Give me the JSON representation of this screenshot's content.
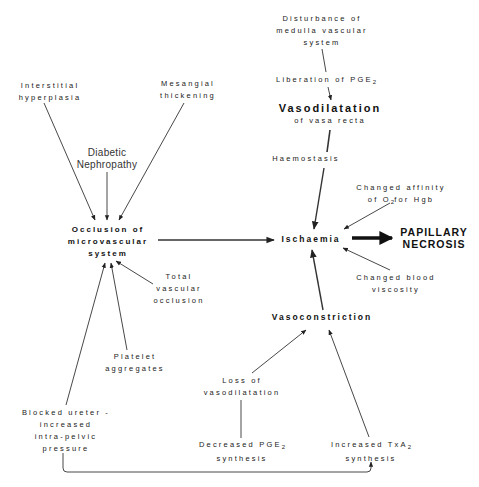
{
  "diagram": {
    "nodes": {
      "disturbance": {
        "lines": [
          "Disturbance of",
          "medulla vascular",
          "system"
        ]
      },
      "liberation": {
        "text": "Liberation of PGE",
        "sub": "2"
      },
      "vasodilatation": {
        "title": "Vasodilatation",
        "subtitle": "of vasa recta"
      },
      "haemostasis": {
        "text": "Haemostasis"
      },
      "interstitial": {
        "lines": [
          "Interstitial",
          "hyperplasia"
        ]
      },
      "mesangial": {
        "lines": [
          "Mesangial",
          "thickening"
        ]
      },
      "diabetic": {
        "lines": [
          "Diabetic",
          "Nephropathy"
        ]
      },
      "occlusion": {
        "lines": [
          "Occlusion of",
          "microvascular",
          "system"
        ]
      },
      "ischaemia": {
        "text": "Ischaemia"
      },
      "necrosis": {
        "lines": [
          "PAPILLARY",
          "NECROSIS"
        ]
      },
      "affinity": {
        "line1": "Changed affinity",
        "line2_pre": "of O",
        "line2_sub": "2",
        "line2_post": "for Hgb"
      },
      "viscosity": {
        "lines": [
          "Changed blood",
          "viscosity"
        ]
      },
      "total_occlusion": {
        "lines": [
          "Total",
          "vascular",
          "occlusion"
        ]
      },
      "vasoconstriction": {
        "text": "Vasoconstriction"
      },
      "platelet": {
        "lines": [
          "Platelet",
          "aggregates"
        ]
      },
      "loss": {
        "lines": [
          "Loss of",
          "vasodilatation"
        ]
      },
      "blocked": {
        "lines": [
          "Blocked ureter -",
          "increased",
          "intra-pelvic",
          "pressure"
        ]
      },
      "decreased_pge": {
        "line1_pre": "Decreased PGE",
        "line1_sub": "2",
        "line2": "synthesis"
      },
      "txa": {
        "line1_pre": "Increased TxA",
        "line1_sub": "2",
        "line2": "synthesis"
      }
    },
    "edges": [
      {
        "from": "disturbance",
        "to": "liberation"
      },
      {
        "from": "liberation",
        "to": "vasodilatation"
      },
      {
        "from": "vasodilatation",
        "to": "haemostasis"
      },
      {
        "from": "haemostasis",
        "to": "ischaemia"
      },
      {
        "from": "interstitial",
        "to": "occlusion"
      },
      {
        "from": "mesangial",
        "to": "occlusion"
      },
      {
        "from": "diabetic",
        "to": "occlusion"
      },
      {
        "from": "total_occlusion",
        "to": "occlusion"
      },
      {
        "from": "platelet",
        "to": "occlusion"
      },
      {
        "from": "blocked",
        "to": "occlusion"
      },
      {
        "from": "occlusion",
        "to": "ischaemia"
      },
      {
        "from": "affinity",
        "to": "ischaemia"
      },
      {
        "from": "viscosity",
        "to": "ischaemia"
      },
      {
        "from": "vasoconstriction",
        "to": "ischaemia"
      },
      {
        "from": "ischaemia",
        "to": "necrosis"
      },
      {
        "from": "loss",
        "to": "vasoconstriction"
      },
      {
        "from": "txa",
        "to": "vasoconstriction"
      },
      {
        "from": "decreased_pge",
        "to": "loss"
      },
      {
        "from": "blocked",
        "to": "txa"
      }
    ]
  }
}
